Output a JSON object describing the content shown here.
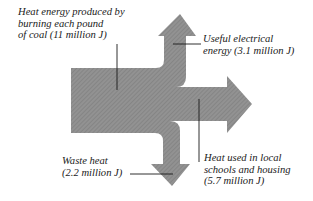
{
  "diagram": {
    "type": "sankey-energy-flow",
    "fill_color": "#8e8e8e",
    "hatch_color": "#7a7a7a",
    "line_color": "#1a1a1a",
    "source": {
      "lines": [
        "Heat energy produced by",
        "burning each pound",
        "of coal (11 million J)"
      ],
      "label": "Heat energy produced by burning each pound of coal",
      "value": 11,
      "unit": "million J"
    },
    "outputs": [
      {
        "id": "electrical",
        "lines": [
          "Useful electrical",
          "energy (3.1 million J)"
        ],
        "label": "Useful electrical energy",
        "value": 3.1,
        "unit": "million J",
        "direction": "up"
      },
      {
        "id": "heat-used",
        "lines": [
          "Heat used in local",
          "schools and housing",
          "(5.7 million J)"
        ],
        "label": "Heat used in local schools and housing",
        "value": 5.7,
        "unit": "million J",
        "direction": "right"
      },
      {
        "id": "waste",
        "lines": [
          "Waste heat",
          "(2.2 million J)"
        ],
        "label": "Waste heat",
        "value": 2.2,
        "unit": "million J",
        "direction": "down"
      }
    ]
  }
}
